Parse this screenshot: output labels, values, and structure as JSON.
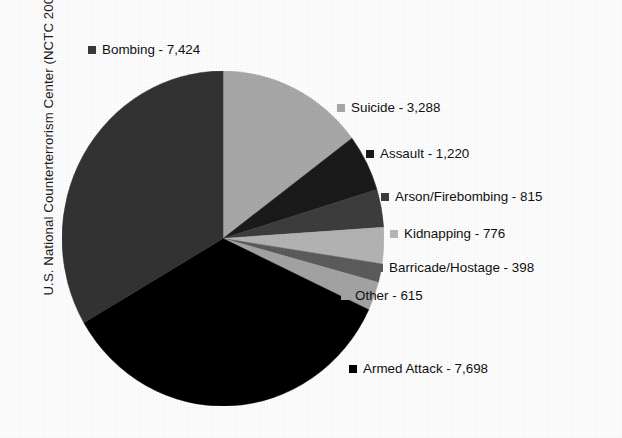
{
  "source_credit": "U.S. National Counterterrorism Center (NCTC 2009)",
  "edge_bleed_text": "",
  "chart_data": {
    "type": "pie",
    "title": "",
    "subtitle": "",
    "xlabel": "",
    "ylabel": "",
    "legend_position": "callout-labels",
    "grid": false,
    "start_angle_deg": 0,
    "direction": "clockwise",
    "total": 22234,
    "categories": [
      "Suicide",
      "Assault",
      "Arson/Firebombing",
      "Kidnapping",
      "Barricade/Hostage",
      "Other",
      "Armed Attack",
      "Bombing"
    ],
    "values": [
      3288,
      1220,
      815,
      776,
      398,
      615,
      7698,
      7424
    ],
    "colors": [
      "#a9a9a9",
      "#1a1a1a",
      "#3d3d3d",
      "#b4b4b4",
      "#5c5c5c",
      "#a4a4a4",
      "#000000",
      "#333333"
    ],
    "slices": [
      {
        "label": "Suicide",
        "value": 3288,
        "value_text": "3,288",
        "color": "#a9a9a9"
      },
      {
        "label": "Assault",
        "value": 1220,
        "value_text": "1,220",
        "color": "#1a1a1a"
      },
      {
        "label": "Arson/Firebombing",
        "value": 815,
        "value_text": "815",
        "color": "#3d3d3d"
      },
      {
        "label": "Kidnapping",
        "value": 776,
        "value_text": "776",
        "color": "#b4b4b4"
      },
      {
        "label": "Barricade/Hostage",
        "value": 398,
        "value_text": "398",
        "color": "#5c5c5c"
      },
      {
        "label": "Other",
        "value": 615,
        "value_text": "615",
        "color": "#a4a4a4"
      },
      {
        "label": "Armed Attack",
        "value": 7698,
        "value_text": "7,698",
        "color": "#000000"
      },
      {
        "label": "Bombing",
        "value": 7424,
        "value_text": "7,424",
        "color": "#333333"
      }
    ]
  },
  "callouts": {
    "bombing": {
      "text": "Bombing - 7,424",
      "color": "#3a3a3a"
    },
    "suicide": {
      "text": "Suicide - 3,288",
      "color": "#a9a9a9"
    },
    "assault": {
      "text": "Assault - 1,220",
      "color": "#1a1a1a"
    },
    "arson": {
      "text": "Arson/Firebombing - 815",
      "color": "#3d3d3d"
    },
    "kidnapping": {
      "text": "Kidnapping - 776",
      "color": "#b8b8b8"
    },
    "barricade": {
      "text": "Barricade/Hostage - 398",
      "color": "#5c5c5c"
    },
    "other": {
      "text": "Other - 615",
      "color": "#a4a4a4"
    },
    "armedattack": {
      "text": "Armed Attack - 7,698",
      "color": "#000000"
    }
  }
}
